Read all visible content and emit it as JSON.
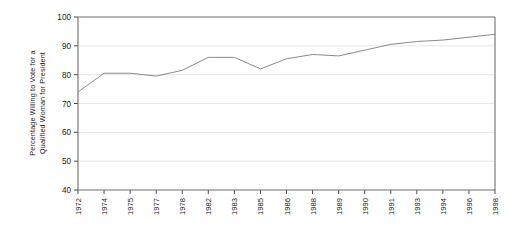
{
  "chart_data": {
    "type": "line",
    "title": "",
    "xlabel": "",
    "ylabel_line1": "Percentage Willing to Vote for a",
    "ylabel_line2": "Qualified Woman for President",
    "ylim": [
      40,
      100
    ],
    "yticks": [
      40,
      50,
      60,
      70,
      80,
      90,
      100
    ],
    "grid": true,
    "legend": "none",
    "categories": [
      "1972",
      "1974",
      "1975",
      "1977",
      "1978",
      "1982",
      "1983",
      "1985",
      "1986",
      "1988",
      "1989",
      "1990",
      "1991",
      "1993",
      "1994",
      "1996",
      "1998"
    ],
    "values": [
      74,
      80.5,
      80.5,
      79.5,
      81.5,
      86,
      86,
      82,
      85.5,
      87,
      86.5,
      88.5,
      90.5,
      91.5,
      92,
      93,
      94
    ],
    "series": [
      {
        "name": "Percentage Willing to Vote for a Qualified Woman for President",
        "values": [
          74,
          80.5,
          80.5,
          79.5,
          81.5,
          86,
          86,
          82,
          85.5,
          87,
          86.5,
          88.5,
          90.5,
          91.5,
          92,
          93,
          94
        ]
      }
    ]
  }
}
